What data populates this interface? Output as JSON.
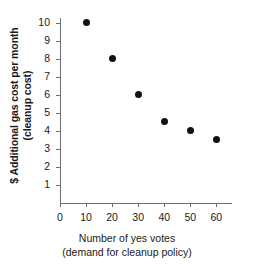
{
  "chart_data": {
    "type": "scatter",
    "title": "",
    "xlabel": "Number of yes votes",
    "xlabel_line2": "(demand for cleanup policy)",
    "ylabel": "$ Additional gas cost per month",
    "ylabel_line2": "(cleanup cost)",
    "x": [
      10,
      20,
      30,
      40,
      50,
      60
    ],
    "values": [
      10,
      8,
      6,
      4.5,
      4,
      3.5
    ],
    "points": [
      {
        "x": 10,
        "y": 10
      },
      {
        "x": 20,
        "y": 8
      },
      {
        "x": 30,
        "y": 6
      },
      {
        "x": 40,
        "y": 4.5
      },
      {
        "x": 50,
        "y": 4
      },
      {
        "x": 60,
        "y": 3.5
      }
    ],
    "xlim": [
      0,
      66
    ],
    "ylim": [
      0,
      10.6
    ],
    "xticks": [
      0,
      10,
      20,
      30,
      40,
      50,
      60
    ],
    "yticks": [
      1,
      2,
      3,
      4,
      5,
      6,
      7,
      8,
      9,
      10
    ],
    "xticklabels": [
      "0",
      "10",
      "20",
      "30",
      "40",
      "50",
      "60"
    ],
    "yticklabels": [
      "1",
      "2",
      "3",
      "4",
      "5",
      "6",
      "7",
      "8",
      "9",
      "10"
    ],
    "grid": false,
    "legend": "none",
    "marker_color": "#111111",
    "axis_color": "#6e6e6e",
    "background": "#ffffff"
  }
}
